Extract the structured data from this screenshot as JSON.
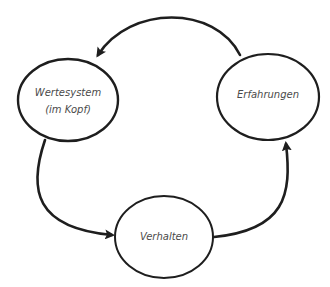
{
  "diagram": {
    "type": "cycle",
    "colors": {
      "stroke": "#1e1e1e",
      "text": "#4a4a4a",
      "background": "#ffffff"
    },
    "nodes": [
      {
        "id": "wertesystem",
        "line1": "Wertesystem",
        "line2": "(im Kopf)"
      },
      {
        "id": "erfahrungen",
        "line1": "Erfahrungen"
      },
      {
        "id": "verhalten",
        "line1": "Verhalten"
      }
    ],
    "edges": [
      {
        "from": "erfahrungen",
        "to": "wertesystem"
      },
      {
        "from": "wertesystem",
        "to": "verhalten"
      },
      {
        "from": "verhalten",
        "to": "erfahrungen"
      }
    ]
  }
}
